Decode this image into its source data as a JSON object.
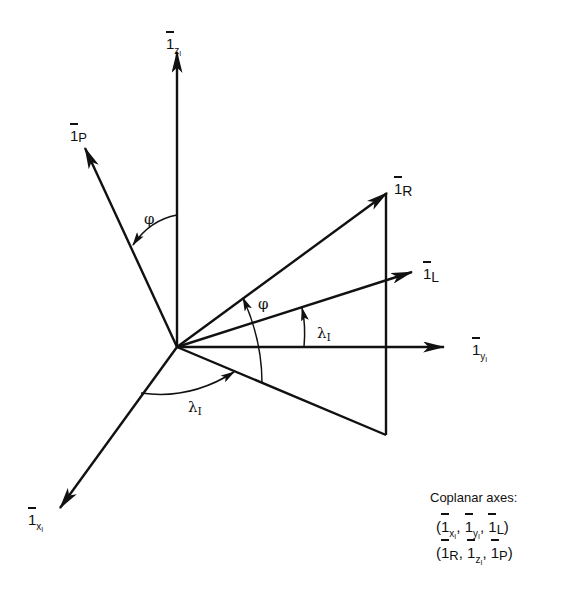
{
  "diagram": {
    "type": "3D coordinate frame diagram",
    "vectors": [
      {
        "id": "1_zI",
        "label_main": "1",
        "label_sub": "z",
        "label_subsub": "I",
        "direction": "up"
      },
      {
        "id": "1_P",
        "label_main": "1",
        "label_sub": "P",
        "direction": "up-left"
      },
      {
        "id": "1_R",
        "label_main": "1",
        "label_sub": "R",
        "direction": "up-right"
      },
      {
        "id": "1_L",
        "label_main": "1",
        "label_sub": "L",
        "direction": "right-slight-up"
      },
      {
        "id": "1_yI",
        "label_main": "1",
        "label_sub": "y",
        "label_subsub": "I",
        "direction": "right"
      },
      {
        "id": "1_xI",
        "label_main": "1",
        "label_sub": "x",
        "label_subsub": "I",
        "direction": "down-left"
      }
    ],
    "angles": [
      {
        "symbol": "φ",
        "between": "1_zI and 1_P"
      },
      {
        "symbol": "φ",
        "between": "lower plane line and 1_R"
      },
      {
        "symbol": "λ",
        "sub": "I",
        "between": "1_yI and 1_L"
      },
      {
        "symbol": "λ",
        "sub": "I",
        "between": "1_xI and lower plane line"
      }
    ],
    "caption": {
      "title": "Coplanar axes:",
      "line1": "(1xI, 1yI, 1L)",
      "line2": "(1R, 1zI, 1P)"
    }
  },
  "labels": {
    "one": "1",
    "z": "z",
    "I": "I",
    "P": "P",
    "R": "R",
    "L": "L",
    "y": "y",
    "x": "x",
    "phi": "φ",
    "lambda": "λ",
    "caption_title": "Coplanar axes:",
    "open_paren": "(",
    "close_paren": ")",
    "comma": ","
  }
}
